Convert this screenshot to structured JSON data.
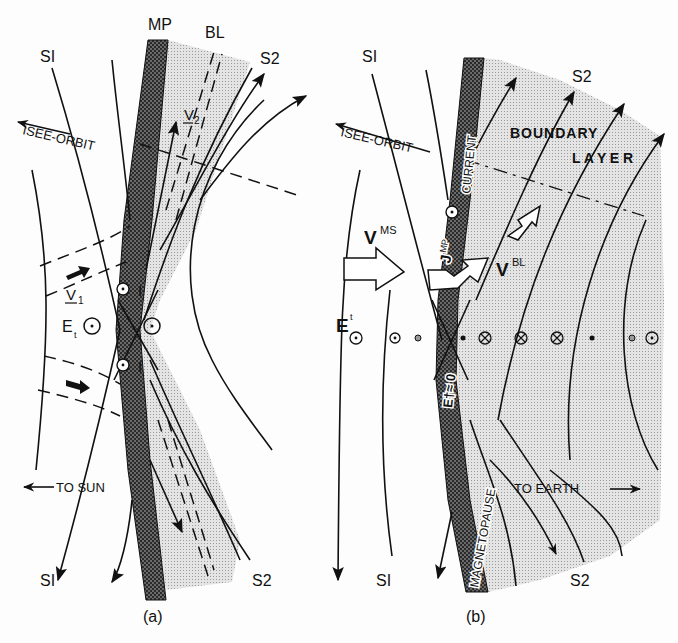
{
  "figure": {
    "panels": [
      {
        "id": "a",
        "caption": "(a)",
        "labels": {
          "magnetopause": "MP",
          "boundary_layer": "BL",
          "field_line_1_top": "SI",
          "field_line_1_bottom": "SI",
          "field_line_2_top": "S2",
          "field_line_2_bottom": "S2",
          "orbit": "ISEE-ORBIT",
          "velocity_1": "V",
          "velocity_1_sub": "1",
          "velocity_2": "V",
          "velocity_2_sub": "2",
          "electric_field": "E",
          "electric_field_sub": "t",
          "current_upper": "I",
          "current_lower": "I",
          "to_sun": "TO SUN"
        }
      },
      {
        "id": "b",
        "caption": "(b)",
        "labels": {
          "field_line_1_top": "SI",
          "field_line_1_bottom": "SI",
          "field_line_2_top": "S2",
          "field_line_2_bottom": "S2",
          "orbit": "ISEE-ORBIT",
          "boundary": "BOUNDARY",
          "layer": "L A Y E R",
          "current": "CURRENT",
          "magnetopause": "MAGNETOPAUSE",
          "j_mp": "J",
          "j_mp_sup": "MP",
          "v_ms": "V",
          "v_ms_sup": "MS",
          "v_bl": "V",
          "v_bl_sup": "BL",
          "e_t": "E",
          "e_t_sup": "t",
          "e_t_zero": "E†≈ 0",
          "to_earth": "TO EARTH"
        },
        "field_symbols": [
          "dot",
          "dot",
          "small-dot",
          "x-dot",
          "cross",
          "cross",
          "cross",
          "x-dot",
          "small-dot",
          "dot"
        ]
      }
    ],
    "colors": {
      "ink": "#111111",
      "magnetopause_fill": "#5a5a5a",
      "boundary_layer_fill": "#d6d6d6",
      "background": "#fdfdfd"
    }
  }
}
